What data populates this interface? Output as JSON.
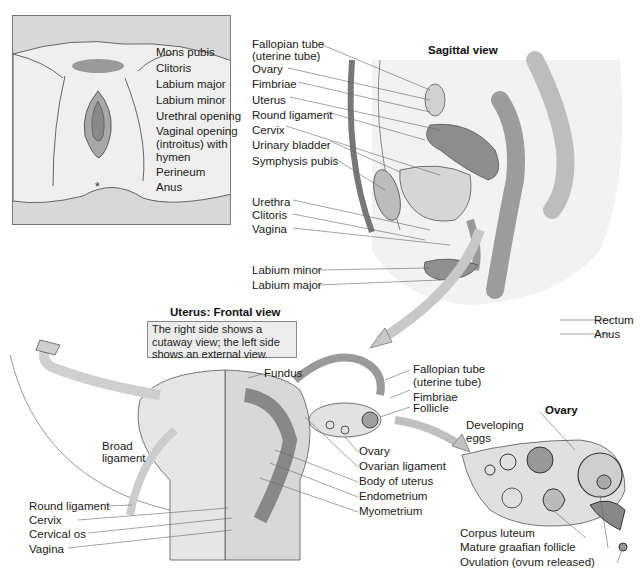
{
  "external": {
    "labels": [
      "Mons pubis",
      "Clitoris",
      "Labium major",
      "Labium minor",
      "Urethral opening",
      "Vaginal opening",
      "(introitus) with",
      "hymen",
      "Perineum",
      "Anus"
    ]
  },
  "sagittal": {
    "title": "Sagittal view",
    "labels_left": [
      "Fallopian tube",
      "(uterine tube)",
      "Ovary",
      "Fimbriae",
      "Uterus",
      "Round ligament",
      "Cervix",
      "Urinary bladder",
      "Symphysis pubis",
      "Urethra",
      "Clitoris",
      "Vagina",
      "Labium minor",
      "Labium major"
    ],
    "labels_right": [
      "Rectum",
      "Anus"
    ]
  },
  "frontal": {
    "title": "Uterus: Frontal view",
    "note": "The right side shows a cutaway view; the left side shows an external view.",
    "labels_left": [
      "Round ligament",
      "Cervix",
      "Cervical os",
      "Vagina"
    ],
    "broad": [
      "Broad",
      "ligament"
    ],
    "fundus": "Fundus",
    "labels_right_top": [
      "Fallopian tube",
      "(uterine tube)",
      "Fimbriae",
      "Follicle"
    ],
    "labels_right_bottom": [
      "Ovary",
      "Ovarian ligament",
      "Body of uterus",
      "Endometrium",
      "Myometrium"
    ]
  },
  "ovary": {
    "title": "Ovary",
    "developing": [
      "Developing",
      "eggs"
    ],
    "labels": [
      "Corpus luteum",
      "Mature graafian follicle",
      "Ovulation (ovum released)"
    ]
  },
  "colors": {
    "tissue_light": "#e4e4e4",
    "tissue_mid": "#b8b8b8",
    "tissue_dark": "#8c8c8c",
    "line": "#555555",
    "panel": "#d8d8d8"
  }
}
